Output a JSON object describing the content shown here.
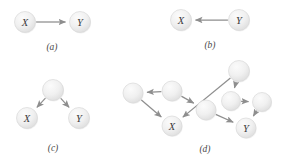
{
  "figure": {
    "background_color": "#ffffff",
    "node_fill_light": "#f4f4f4",
    "node_fill_dark": "#e0e0e0",
    "node_stroke": "#d8d8d8",
    "edge_color": "#8e8e8e",
    "label_color": "#3a3a3a",
    "caption_color": "#4a4a4a"
  },
  "panels": [
    {
      "id": "a",
      "caption": "(a)",
      "caption_pos": {
        "x": 52,
        "y": 47
      },
      "nodes": [
        {
          "id": "a-x",
          "label": "X",
          "x": 25,
          "y": 22,
          "r": 10.5
        },
        {
          "id": "a-y",
          "label": "Y",
          "x": 80,
          "y": 22,
          "r": 10.5
        }
      ],
      "edges": [
        {
          "from": "a-x",
          "to": "a-y"
        }
      ]
    },
    {
      "id": "b",
      "caption": "(b)",
      "caption_pos": {
        "x": 210,
        "y": 45
      },
      "nodes": [
        {
          "id": "b-x",
          "label": "X",
          "x": 181,
          "y": 20,
          "r": 10.5
        },
        {
          "id": "b-y",
          "label": "Y",
          "x": 239,
          "y": 20,
          "r": 10.5
        }
      ],
      "edges": [
        {
          "from": "b-y",
          "to": "b-x"
        }
      ]
    },
    {
      "id": "c",
      "caption": "(c)",
      "caption_pos": {
        "x": 53,
        "y": 148
      },
      "nodes": [
        {
          "id": "c-u",
          "label": "",
          "x": 53,
          "y": 90,
          "r": 10.5
        },
        {
          "id": "c-x",
          "label": "X",
          "x": 27,
          "y": 118,
          "r": 10.5
        },
        {
          "id": "c-y",
          "label": "Y",
          "x": 79,
          "y": 118,
          "r": 10.5
        }
      ],
      "edges": [
        {
          "from": "c-u",
          "to": "c-x"
        },
        {
          "from": "c-u",
          "to": "c-y"
        }
      ]
    },
    {
      "id": "d",
      "caption": "(d)",
      "caption_pos": {
        "x": 205,
        "y": 149
      },
      "nodes": [
        {
          "id": "d-n1",
          "label": "",
          "x": 133,
          "y": 93,
          "r": 10.0
        },
        {
          "id": "d-n2",
          "label": "",
          "x": 172,
          "y": 91,
          "r": 10.0
        },
        {
          "id": "d-n3",
          "label": "",
          "x": 206,
          "y": 110,
          "r": 10.0
        },
        {
          "id": "d-n4",
          "label": "",
          "x": 239,
          "y": 71,
          "r": 10.5
        },
        {
          "id": "d-n5",
          "label": "",
          "x": 231,
          "y": 101,
          "r": 9.5
        },
        {
          "id": "d-n6",
          "label": "",
          "x": 262,
          "y": 102,
          "r": 9.5
        },
        {
          "id": "d-x",
          "label": "X",
          "x": 172,
          "y": 126,
          "r": 10.0
        },
        {
          "id": "d-y",
          "label": "Y",
          "x": 246,
          "y": 128,
          "r": 10.0
        }
      ],
      "edges": [
        {
          "from": "d-n2",
          "to": "d-n1"
        },
        {
          "from": "d-n1",
          "to": "d-x"
        },
        {
          "from": "d-n2",
          "to": "d-n3"
        },
        {
          "from": "d-n4",
          "to": "d-x"
        },
        {
          "from": "d-n4",
          "to": "d-n5"
        },
        {
          "from": "d-n5",
          "to": "d-n6"
        },
        {
          "from": "d-n6",
          "to": "d-y"
        },
        {
          "from": "d-n3",
          "to": "d-y"
        }
      ]
    }
  ]
}
